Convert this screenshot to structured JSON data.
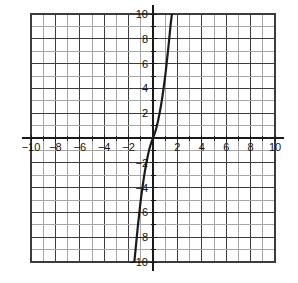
{
  "figure": {
    "title": "",
    "background_color": "#ffffff"
  },
  "chart_data": {
    "type": "line",
    "title": "",
    "xlabel": "",
    "ylabel": "",
    "xlim": [
      -10,
      10
    ],
    "ylim": [
      -10,
      10
    ],
    "grid": true,
    "grid_step": 1,
    "legend": "none",
    "x_tick_labels": [
      "-10",
      "-8",
      "-6",
      "-4",
      "-2",
      "2",
      "4",
      "6",
      "8",
      "10"
    ],
    "x_tick_values": [
      -10,
      -8,
      -6,
      -4,
      -2,
      2,
      4,
      6,
      8,
      10
    ],
    "y_tick_labels": [
      "10",
      "8",
      "6",
      "4",
      "2",
      "-2",
      "-4",
      "-6",
      "-8",
      "-10"
    ],
    "y_tick_values": [
      10,
      8,
      6,
      4,
      2,
      -2,
      -4,
      -6,
      -8,
      -10
    ],
    "series": [
      {
        "name": "curve",
        "color": "#1a1a1a",
        "line_width": 2.2,
        "x": [
          -1.53,
          -1.45,
          -1.35,
          -1.25,
          -1.15,
          -1.05,
          -0.95,
          -0.85,
          -0.75,
          -0.65,
          -0.55,
          -0.45,
          -0.35,
          -0.25,
          -0.15,
          -0.05,
          0.0,
          0.05,
          0.15,
          0.25,
          0.35,
          0.45,
          0.55,
          0.65,
          0.75,
          0.85,
          0.95,
          1.05,
          1.15,
          1.25,
          1.35,
          1.45,
          1.55
        ],
        "y": [
          -10.0,
          -9.2,
          -8.2,
          -7.2,
          -6.3,
          -5.4,
          -4.6,
          -3.9,
          -3.2,
          -2.6,
          -2.05,
          -1.55,
          -1.1,
          -0.72,
          -0.4,
          -0.13,
          0.0,
          0.13,
          0.4,
          0.72,
          1.1,
          1.55,
          2.05,
          2.6,
          3.2,
          3.9,
          4.6,
          5.4,
          6.3,
          7.2,
          8.2,
          9.2,
          10.0
        ]
      }
    ]
  },
  "colors": {
    "curve": "#1a1a1a",
    "axis": "#1a1a1a",
    "grid_major": "#3c3c3c",
    "grid_minor": "#a6a6a6",
    "label": "#121212",
    "background": "#ffffff"
  },
  "geometry": {
    "plot_left": 31,
    "plot_top": 14,
    "plot_right": 275,
    "plot_bottom": 262,
    "origin_x": 153,
    "origin_y": 138,
    "unit_px_x": 12.2,
    "unit_px_y": 12.4
  }
}
